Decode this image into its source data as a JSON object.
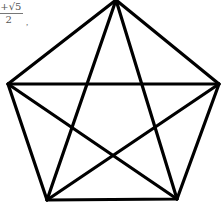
{
  "caption": {
    "numerator": "1+√5",
    "denominator": "2",
    "trailing": ","
  },
  "figure": {
    "type": "pentagon with inscribed pentagram (all diagonals drawn)",
    "stroke_color": "#000000",
    "vertices": {
      "top": [
        116,
        0
      ],
      "left": [
        8,
        84
      ],
      "right": [
        219,
        84
      ],
      "bottom_left": [
        47,
        200
      ],
      "bottom_right": [
        177,
        199
      ]
    }
  }
}
